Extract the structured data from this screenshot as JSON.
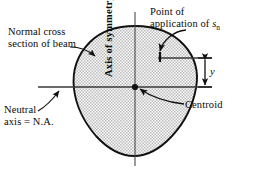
{
  "figure": {
    "background_color": "#ffffff",
    "line_color": "#111111",
    "fill_color": "#d8d8d8",
    "axis_color": "#3a3a3a"
  },
  "labels": {
    "normal_cross_section": {
      "line1": "Normal cross",
      "line2": "section of beam"
    },
    "point_of_application": {
      "line1": "Point of",
      "line2_prefix": "application of ",
      "symbol": "s",
      "symbol_subscript": "n"
    },
    "neutral_axis": {
      "line1": "Neutral",
      "line2": "axis = N.A."
    },
    "centroid": "Centroid",
    "axis_of_symmetry": "Axis of symmetry",
    "y_dimension": "y"
  },
  "geometry": {
    "shape_name": "normal-cross-section-outline",
    "centroid_point": {
      "x": 135,
      "y": 87
    },
    "application_point": {
      "x": 160,
      "y": 58
    },
    "neutral_axis_line": {
      "x1": 38,
      "y1": 87,
      "x2": 212,
      "y2": 87
    },
    "upper_reference_line": {
      "x1": 158,
      "y1": 58,
      "x2": 212,
      "y2": 58
    },
    "symmetry_axis_line": {
      "x1": 135,
      "y1": 12,
      "x2": 135,
      "y2": 166
    },
    "dimension_arrow": {
      "x": 205,
      "y_top": 58,
      "y_bottom": 87
    }
  }
}
